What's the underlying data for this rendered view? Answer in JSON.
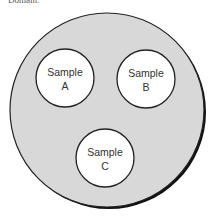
{
  "caption": "Domain.",
  "diagram": {
    "outer": {
      "fill": "#d8d8d8",
      "stroke": "#1a1a1a"
    },
    "samples": [
      {
        "line1": "Sample",
        "line2": "A"
      },
      {
        "line1": "Sample",
        "line2": "B"
      },
      {
        "line1": "Sample",
        "line2": "C"
      }
    ]
  }
}
